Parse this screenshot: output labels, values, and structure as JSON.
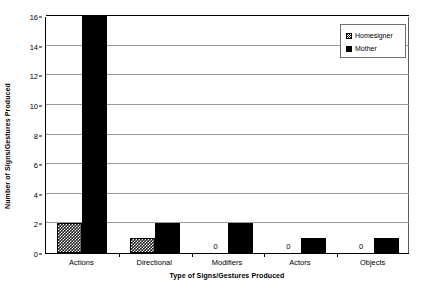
{
  "chart_data": {
    "type": "bar",
    "title": "",
    "xlabel": "Type of Signs/Gestures Produced",
    "ylabel": "Number of Signs/Gestures Produced",
    "categories": [
      "Actions",
      "Directional",
      "Modifiers",
      "Actors",
      "Objects"
    ],
    "series": [
      {
        "name": "Homesigner",
        "values": [
          2,
          1,
          0,
          0,
          0
        ],
        "fill": "crosshatch",
        "color": "#000000"
      },
      {
        "name": "Mother",
        "values": [
          16,
          2,
          2,
          1,
          1
        ],
        "fill": "solid",
        "color": "#000000"
      }
    ],
    "value_labels": [
      {
        "series": "Homesigner",
        "category": "Modifiers",
        "text": "0"
      },
      {
        "series": "Homesigner",
        "category": "Actors",
        "text": "0"
      },
      {
        "series": "Homesigner",
        "category": "Objects",
        "text": "0"
      }
    ],
    "ylim": [
      0,
      16
    ],
    "yticks": [
      0,
      2,
      4,
      6,
      8,
      10,
      12,
      14,
      16
    ],
    "ytick_labels": [
      "0",
      "2",
      "4",
      "6",
      "8",
      "10",
      "12",
      "14",
      "16"
    ],
    "grid": true,
    "grid_axis": "y",
    "grid_color": "#9a9a9a",
    "legend": {
      "position": "top-right",
      "entries": [
        {
          "label": "Homesigner",
          "swatch": "crosshatch"
        },
        {
          "label": "Mother",
          "swatch": "solid"
        }
      ]
    },
    "background": "#ffffff",
    "axis_color": "#000000"
  }
}
